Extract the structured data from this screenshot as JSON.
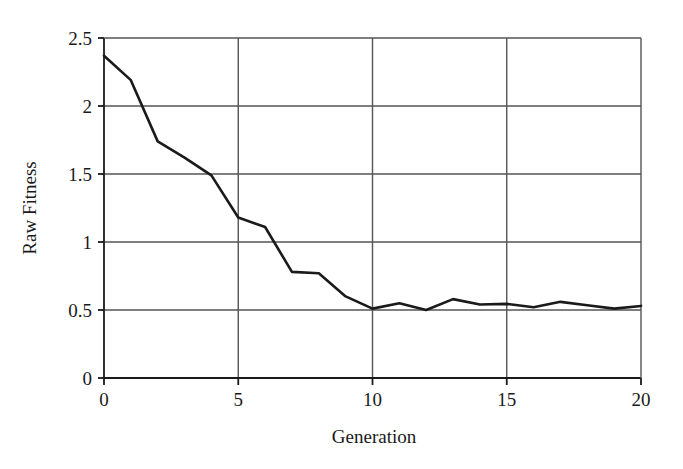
{
  "chart_data": {
    "type": "line",
    "title": "",
    "xlabel": "Generation",
    "ylabel": "Raw Fitness",
    "x": [
      0,
      1,
      2,
      3,
      4,
      5,
      6,
      7,
      8,
      9,
      10,
      11,
      12,
      13,
      14,
      15,
      16,
      17,
      18,
      19,
      20
    ],
    "values": [
      2.37,
      2.19,
      1.74,
      1.62,
      1.49,
      1.18,
      1.11,
      0.78,
      0.77,
      0.6,
      0.51,
      0.55,
      0.5,
      0.58,
      0.54,
      0.545,
      0.52,
      0.56,
      0.535,
      0.51,
      0.53
    ],
    "series": [
      {
        "name": "Raw Fitness",
        "values": [
          2.37,
          2.19,
          1.74,
          1.62,
          1.49,
          1.18,
          1.11,
          0.78,
          0.77,
          0.6,
          0.51,
          0.55,
          0.5,
          0.58,
          0.54,
          0.545,
          0.52,
          0.56,
          0.535,
          0.51,
          0.53
        ]
      }
    ],
    "xlim": [
      0,
      20
    ],
    "ylim": [
      0,
      2.5
    ],
    "xticks": [
      0,
      5,
      10,
      15,
      20
    ],
    "yticks": [
      0,
      0.5,
      1,
      1.5,
      2,
      2.5
    ],
    "xticklabels": [
      "0",
      "5",
      "10",
      "15",
      "20"
    ],
    "yticklabels": [
      "0",
      "0.5",
      "1",
      "1.5",
      "2",
      "2.5"
    ],
    "grid": "horizontal-and-vertical",
    "legend": "none",
    "line_color": "#1a1a1a",
    "grid_color": "#555555",
    "axis_color": "#1a1a1a",
    "background_color": "#ffffff"
  },
  "axes": {
    "x_label": "Generation",
    "y_label": "Raw Fitness"
  }
}
